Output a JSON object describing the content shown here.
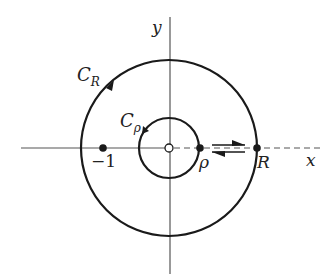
{
  "diagram": {
    "type": "contour-diagram",
    "colors": {
      "stroke": "#1a1a1a",
      "axis": "#444444",
      "background": "#ffffff"
    },
    "axes": {
      "x_label": "x",
      "y_label": "y"
    },
    "contours": {
      "outer": {
        "label_main": "C",
        "label_sub": "R"
      },
      "inner": {
        "label_main": "C",
        "label_sub": "ρ"
      }
    },
    "points": {
      "neg_one": "−1",
      "rho": "ρ",
      "R": "R"
    }
  }
}
